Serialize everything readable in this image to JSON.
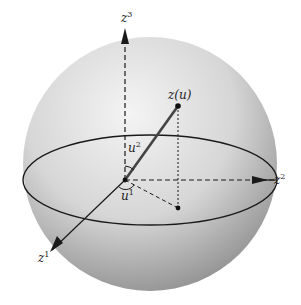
{
  "figure": {
    "colors": {
      "sphere_light": "#f2f2f2",
      "sphere_dark": "#8c8c8c",
      "line": "#1a1a1a"
    },
    "labels": {
      "axis_z3": {
        "base": "z",
        "sup": "3"
      },
      "axis_z2": {
        "base": "z",
        "sup": "2"
      },
      "axis_z1": {
        "base": "z",
        "sup": "1"
      },
      "point": "z(u)",
      "angle_u2": {
        "base": "u",
        "sup": "2"
      },
      "angle_u1": {
        "base": "u",
        "sup": "1"
      }
    }
  }
}
